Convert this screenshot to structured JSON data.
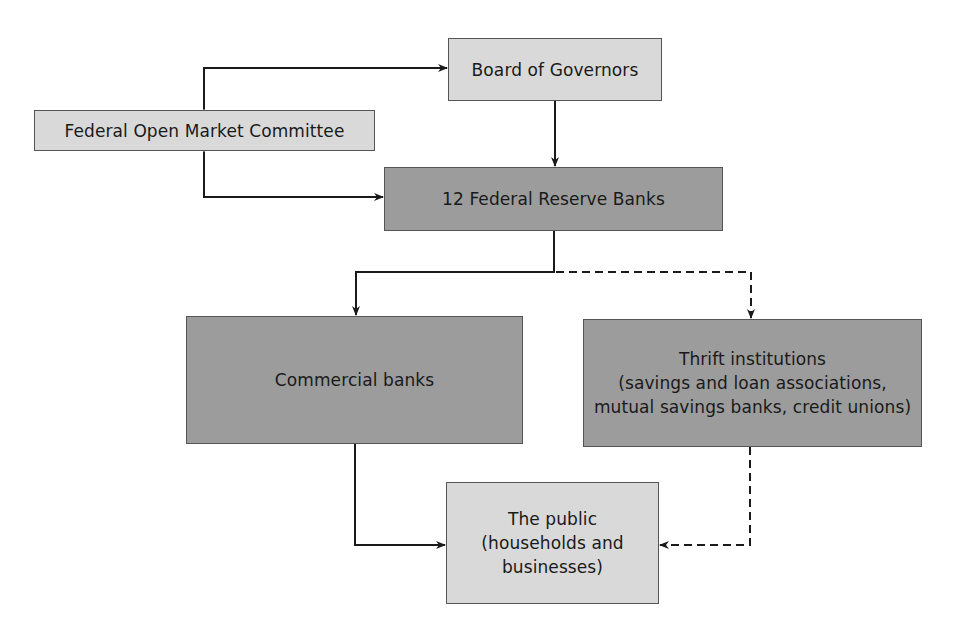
{
  "diagram": {
    "colors": {
      "light_box": "#d9d9d9",
      "dark_box": "#9c9c9c",
      "border": "#555555",
      "line": "#1a1a1a",
      "text": "#1a1a1a"
    },
    "nodes": {
      "board": {
        "label": "Board of Governors"
      },
      "fomc": {
        "label": "Federal Open Market Committee"
      },
      "reserve_banks": {
        "label": "12 Federal Reserve Banks"
      },
      "commercial": {
        "label": "Commercial banks"
      },
      "thrift": {
        "line1": "Thrift institutions",
        "line2": "(savings and loan associations,",
        "line3": "mutual savings banks, credit unions)"
      },
      "public": {
        "line1": "The public",
        "line2": "(households and",
        "line3": "businesses)"
      }
    },
    "edges": [
      {
        "from": "fomc",
        "to": "board",
        "style": "solid",
        "bidirectional": true
      },
      {
        "from": "board",
        "to": "reserve_banks",
        "style": "solid"
      },
      {
        "from": "fomc",
        "to": "reserve_banks",
        "style": "solid",
        "bidirectional": true
      },
      {
        "from": "reserve_banks",
        "to": "commercial",
        "style": "solid"
      },
      {
        "from": "reserve_banks",
        "to": "thrift",
        "style": "dashed"
      },
      {
        "from": "commercial",
        "to": "public",
        "style": "solid"
      },
      {
        "from": "thrift",
        "to": "public",
        "style": "dashed"
      }
    ]
  }
}
